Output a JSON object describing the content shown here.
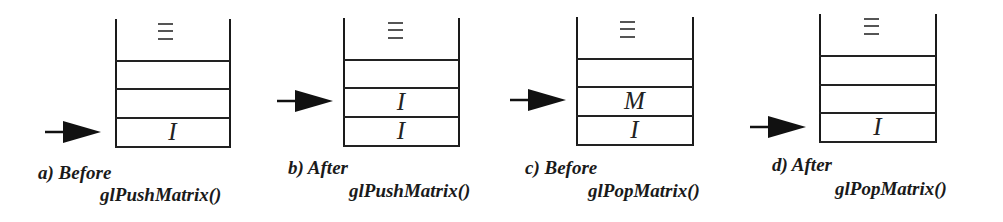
{
  "figure": {
    "panels": [
      {
        "id": "a",
        "caption_line1": "a) Before",
        "caption_line2": "glPushMatrix()",
        "top_marker": "⋮",
        "cells_top_to_bottom": [
          "",
          "",
          "I"
        ],
        "pointer_at_cell": 3
      },
      {
        "id": "b",
        "caption_line1": "b) After",
        "caption_line2": "glPushMatrix()",
        "top_marker": "⋮",
        "cells_top_to_bottom": [
          "",
          "I",
          "I"
        ],
        "pointer_at_cell": 2
      },
      {
        "id": "c",
        "caption_line1": "c) Before",
        "caption_line2": "glPopMatrix()",
        "top_marker": "⋮",
        "cells_top_to_bottom": [
          "",
          "M",
          "I"
        ],
        "pointer_at_cell": 2
      },
      {
        "id": "d",
        "caption_line1": "d) After",
        "caption_line2": "glPopMatrix()",
        "top_marker": "⋮",
        "cells_top_to_bottom": [
          "",
          "",
          "I"
        ],
        "pointer_at_cell": 3
      }
    ],
    "colors": {
      "line": "#1a1a1a",
      "arrow": "#111111",
      "text": "#1a1a1a",
      "background": "#ffffff"
    }
  }
}
